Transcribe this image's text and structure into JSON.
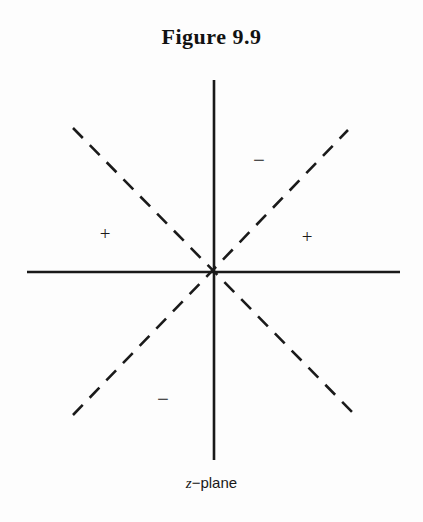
{
  "figure": {
    "title": "Figure 9.9",
    "caption_variable": "z",
    "caption_rest": "−plane",
    "caption_full": "z−plane",
    "background_color": "#fdfdfd",
    "ink_color": "#1a1a1a"
  },
  "chart_data": {
    "type": "scatter",
    "title": "Figure 9.9",
    "subtitle": "z−plane",
    "xlabel": "",
    "ylabel": "",
    "grid": false,
    "legend": "none",
    "axes": {
      "origin": {
        "x": 214,
        "y": 272
      },
      "horizontal": {
        "x_start": 27,
        "x_end": 400,
        "y": 272,
        "style": "solid",
        "width": 2.6
      },
      "vertical": {
        "y_start": 80,
        "y_end": 460,
        "x": 214,
        "style": "solid",
        "width": 2.6
      }
    },
    "dashed_lines": [
      {
        "name": "asymptote-negative-slope",
        "style": "dashed",
        "angle_deg": -45,
        "width": 2.6,
        "dash": "14 10",
        "x1": 73,
        "y1": 128,
        "x2": 355,
        "y2": 415
      },
      {
        "name": "asymptote-positive-slope",
        "style": "dashed",
        "angle_deg": 45,
        "width": 2.6,
        "dash": "14 10",
        "x1": 73,
        "y1": 415,
        "x2": 348,
        "y2": 130
      }
    ],
    "sector_labels": [
      {
        "name": "sector-left-plus",
        "text": "+",
        "x": 105,
        "y": 233,
        "sector": "left"
      },
      {
        "name": "sector-right-plus",
        "text": "+",
        "x": 307,
        "y": 236,
        "sector": "right"
      },
      {
        "name": "sector-top-minus",
        "text": "−",
        "x": 259,
        "y": 160,
        "sector": "top"
      },
      {
        "name": "sector-bottom-minus",
        "text": "−",
        "x": 163,
        "y": 399,
        "sector": "bottom"
      }
    ]
  }
}
